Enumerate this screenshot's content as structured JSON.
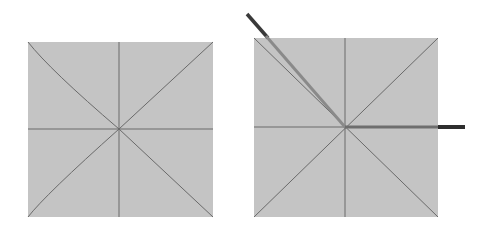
{
  "diagram": {
    "panels": [
      {
        "name": "left-panel",
        "square": {
          "x": 28,
          "y": 42,
          "w": 185,
          "h": 175,
          "fill": "#c4c4c4"
        },
        "center": {
          "x": 119,
          "y": 129
        },
        "guide_color": "#6a6a6a"
      },
      {
        "name": "right-panel",
        "square": {
          "x": 254,
          "y": 38,
          "w": 184,
          "h": 179,
          "fill": "#c4c4c4"
        },
        "center": {
          "x": 345,
          "y": 127
        },
        "guide_color": "#6a6a6a",
        "vectors": [
          {
            "name": "diagonal-vector",
            "from": [
              345,
              127
            ],
            "to": [
              247,
              14
            ],
            "inner_color": "#8a8a8a",
            "outer_color": "#3a3a3a"
          },
          {
            "name": "horizontal-vector",
            "from": [
              345,
              127
            ],
            "to": [
              465,
              127
            ],
            "inner_color": "#7a7a7a",
            "outer_color": "#2e2e2e"
          }
        ]
      }
    ]
  }
}
